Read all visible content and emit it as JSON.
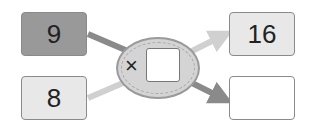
{
  "inputs": [
    {
      "value": "9",
      "style": "dark"
    },
    {
      "value": "8",
      "style": "light"
    }
  ],
  "operator": {
    "symbol": "×",
    "operand": ""
  },
  "outputs": [
    {
      "value": "16",
      "style": "light"
    },
    {
      "value": "",
      "style": "white"
    }
  ],
  "colors": {
    "dark_box": "#999999",
    "light_box": "#e8e8e8",
    "dark_arrow": "#8a8a8a",
    "light_arrow": "#d0d0d0"
  }
}
